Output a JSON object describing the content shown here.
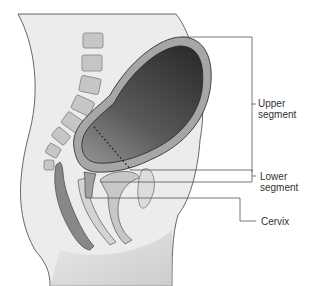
{
  "diagram": {
    "labels": {
      "upper_segment": [
        "Upper",
        "segment"
      ],
      "lower_segment": [
        "Lower",
        "segment"
      ],
      "cervix": "Cervix"
    },
    "colors": {
      "skin": "#e8e8e8",
      "outline": "#444444",
      "uterine_wall": "#a8a8a8",
      "cavity_dark": "#3a3a3a",
      "cavity_light": "#8a8a8a",
      "vertebra": "#c4c4c4",
      "leader_line": "#555555"
    }
  }
}
